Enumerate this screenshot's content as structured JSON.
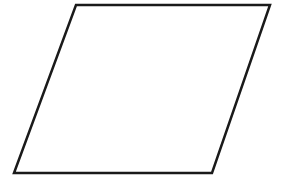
{
  "diagram": {
    "title": "",
    "shape_type": "parallelogram",
    "stroke_color": "#1a1a1a",
    "fill_color": "#ffffff",
    "background_color": "#ffffff",
    "labels": []
  }
}
